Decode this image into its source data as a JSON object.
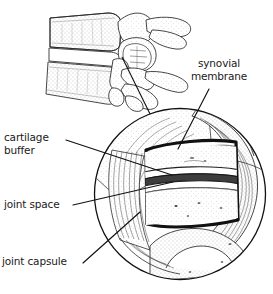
{
  "figure": {
    "background_color": "#ffffff",
    "ink_color": "#1a1a1a",
    "shade_color": "#b9b9b9"
  },
  "labels": {
    "cartilage_buffer": "cartilage\nbuffer",
    "joint_space": "joint space",
    "joint_capsule": "joint capsule",
    "synovial_membrane": "synovial\nmembrane"
  },
  "callouts": [
    {
      "name": "cartilage-buffer",
      "from": [
        66,
        141
      ],
      "to": [
        163,
        172
      ]
    },
    {
      "name": "joint-space",
      "from": [
        72,
        205
      ],
      "to": [
        165,
        181
      ]
    },
    {
      "name": "joint-capsule",
      "from": [
        82,
        264
      ],
      "to": [
        140,
        213
      ]
    },
    {
      "name": "synovial-membrane",
      "from": [
        209,
        88
      ],
      "to": [
        178,
        148
      ]
    },
    {
      "name": "magnifier-link",
      "from": [
        122,
        57
      ],
      "to": [
        150,
        116
      ]
    }
  ],
  "detail_circle": {
    "cx": 180,
    "cy": 194,
    "r": 86
  },
  "anatomy_parts": [
    "superior vertebral body",
    "inferior vertebral body",
    "spinous process",
    "transverse process",
    "superior articular facet",
    "inferior articular facet",
    "articular cartilage",
    "joint space",
    "synovial membrane",
    "joint capsule"
  ]
}
